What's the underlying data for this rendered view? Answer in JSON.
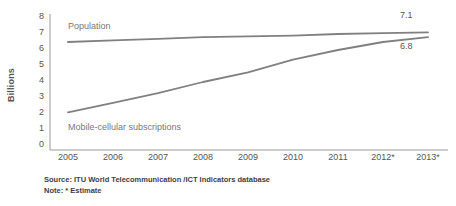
{
  "chart_data": {
    "type": "line",
    "title": "",
    "xlabel": "",
    "ylabel": "Billions",
    "ylim": [
      0,
      8
    ],
    "yticks": [
      "0",
      "1",
      "2",
      "3",
      "4",
      "5",
      "6",
      "7",
      "8"
    ],
    "categories": [
      "2005",
      "2006",
      "2007",
      "2008",
      "2009",
      "2010",
      "2011",
      "2012*",
      "2013*"
    ],
    "grid": false,
    "legend_position": "inline-annotation",
    "line_color": "#808080",
    "series": [
      {
        "name": "Population",
        "values": [
          6.5,
          6.6,
          6.7,
          6.8,
          6.85,
          6.9,
          7.0,
          7.05,
          7.1
        ],
        "end_label": "7.1"
      },
      {
        "name": "Mobile-cellular subscriptions",
        "values": [
          2.1,
          2.7,
          3.3,
          4.0,
          4.6,
          5.4,
          6.0,
          6.5,
          6.8
        ],
        "end_label": "6.8"
      }
    ],
    "annotations": [
      {
        "text": "Population",
        "series": "Population"
      },
      {
        "text": "Mobile-cellular subscriptions",
        "series": "Mobile-cellular subscriptions"
      },
      {
        "text": "7.1",
        "series": "Population"
      },
      {
        "text": "6.8",
        "series": "Mobile-cellular subscriptions"
      }
    ]
  },
  "footnotes": {
    "source": "Source:  ITU World Telecommunication /ICT Indicators database",
    "note": "Note: * Estimate"
  }
}
